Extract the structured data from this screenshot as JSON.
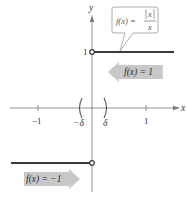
{
  "axes": {
    "x_label": "x",
    "y_label": "y",
    "x_ticks": [
      {
        "label": "−1",
        "value": -1
      },
      {
        "label": "1",
        "value": 1
      }
    ],
    "y_ticks": [
      {
        "label": "1",
        "value": 1
      }
    ],
    "interval_left_label": "−δ",
    "interval_right_label": "δ"
  },
  "callout": {
    "lhs": "f(x) =",
    "numerator": "x",
    "denominator": "x"
  },
  "annotations": {
    "upper_label": "f(x) = 1",
    "lower_label": "f(x) = −1"
  },
  "colors": {
    "graph_line": "#3a3a3a",
    "axis": "#777777",
    "arrow_fill": "#c8c8c8",
    "callout_border": "#9a9a9a"
  }
}
